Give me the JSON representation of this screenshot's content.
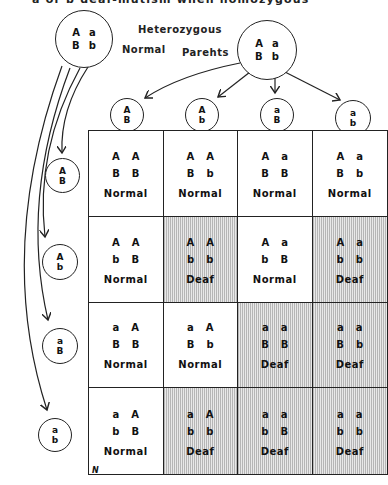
{
  "title": "a or b   deaf-mutism  when  homozygous",
  "parents": {
    "label_line1": "Heterozygous",
    "label_normal": "Normal",
    "label_parents": "Parehts",
    "left": {
      "row1": [
        "A",
        "a"
      ],
      "row2": [
        "B",
        "b"
      ]
    },
    "right": {
      "row1": [
        "A",
        "a"
      ],
      "row2": [
        "B",
        "b"
      ]
    }
  },
  "top_gametes": [
    {
      "top": "A",
      "bottom": "B"
    },
    {
      "top": "A",
      "bottom": "b"
    },
    {
      "top": "a",
      "bottom": "B"
    },
    {
      "top": "a",
      "bottom": "b"
    }
  ],
  "side_gametes": [
    {
      "top": "A",
      "bottom": "B"
    },
    {
      "top": "A",
      "bottom": "b"
    },
    {
      "top": "a",
      "bottom": "B"
    },
    {
      "top": "a",
      "bottom": "b"
    }
  ],
  "punnett": [
    [
      {
        "r1": [
          "A",
          "A"
        ],
        "r2": [
          "B",
          "B"
        ],
        "phenotype": "Normal"
      },
      {
        "r1": [
          "A",
          "A"
        ],
        "r2": [
          "B",
          "b"
        ],
        "phenotype": "Normal"
      },
      {
        "r1": [
          "A",
          "a"
        ],
        "r2": [
          "B",
          "B"
        ],
        "phenotype": "Normal"
      },
      {
        "r1": [
          "A",
          "a"
        ],
        "r2": [
          "B",
          "b"
        ],
        "phenotype": "Normal"
      }
    ],
    [
      {
        "r1": [
          "A",
          "A"
        ],
        "r2": [
          "b",
          "B"
        ],
        "phenotype": "Normal"
      },
      {
        "r1": [
          "A",
          "A"
        ],
        "r2": [
          "b",
          "b"
        ],
        "phenotype": "Deaf"
      },
      {
        "r1": [
          "A",
          "a"
        ],
        "r2": [
          "b",
          "B"
        ],
        "phenotype": "Normal"
      },
      {
        "r1": [
          "A",
          "a"
        ],
        "r2": [
          "b",
          "b"
        ],
        "phenotype": "Deaf"
      }
    ],
    [
      {
        "r1": [
          "a",
          "A"
        ],
        "r2": [
          "B",
          "B"
        ],
        "phenotype": "Normal"
      },
      {
        "r1": [
          "a",
          "A"
        ],
        "r2": [
          "B",
          "b"
        ],
        "phenotype": "Normal"
      },
      {
        "r1": [
          "a",
          "a"
        ],
        "r2": [
          "B",
          "B"
        ],
        "phenotype": "Deaf"
      },
      {
        "r1": [
          "a",
          "a"
        ],
        "r2": [
          "B",
          "b"
        ],
        "phenotype": "Deaf"
      }
    ],
    [
      {
        "r1": [
          "a",
          "A"
        ],
        "r2": [
          "b",
          "B"
        ],
        "phenotype": "Normal"
      },
      {
        "r1": [
          "a",
          "A"
        ],
        "r2": [
          "b",
          "b"
        ],
        "phenotype": "Deaf"
      },
      {
        "r1": [
          "a",
          "a"
        ],
        "r2": [
          "b",
          "B"
        ],
        "phenotype": "Deaf"
      },
      {
        "r1": [
          "a",
          "a"
        ],
        "r2": [
          "b",
          "b"
        ],
        "phenotype": "Deaf"
      }
    ]
  ],
  "corner_mark": "N",
  "colors": {
    "ink": "#222222",
    "deaf_shade": "#c8c8c8",
    "background": "#ffffff"
  }
}
